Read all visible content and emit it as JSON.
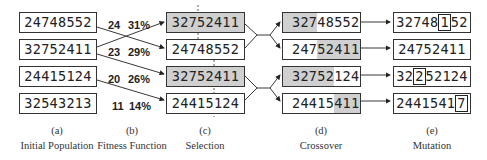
{
  "columns": {
    "a": {
      "letter": "(a)",
      "title": "Initial Population",
      "values": [
        "24748552",
        "32752411",
        "24415124",
        "32543213"
      ]
    },
    "b": {
      "letter": "(b)",
      "title": "Fitness Function",
      "scores": [
        "24",
        "23",
        "20",
        "11"
      ],
      "percents": [
        "31%",
        "29%",
        "26%",
        "14%"
      ]
    },
    "c": {
      "letter": "(c)",
      "title": "Selection",
      "values": [
        "32752411",
        "24748552",
        "32752411",
        "24415124"
      ]
    },
    "d": {
      "letter": "(d)",
      "title": "Crossover",
      "rows": [
        {
          "left": "327",
          "right": "48552",
          "left_shaded": true
        },
        {
          "left": "247",
          "right": "52411",
          "left_shaded": false
        },
        {
          "left": "32752",
          "right": "124",
          "left_shaded": true
        },
        {
          "left": "24415",
          "right": "411",
          "left_shaded": false
        }
      ]
    },
    "e": {
      "letter": "(e)",
      "title": "Mutation",
      "rows": [
        {
          "pre": "32748",
          "mut": "1",
          "post": "52"
        },
        {
          "pre": "24752411",
          "mut": "",
          "post": ""
        },
        {
          "pre": "32",
          "mut": "2",
          "post": "52124"
        },
        {
          "pre": "2441541",
          "mut": "7",
          "post": ""
        }
      ]
    }
  }
}
